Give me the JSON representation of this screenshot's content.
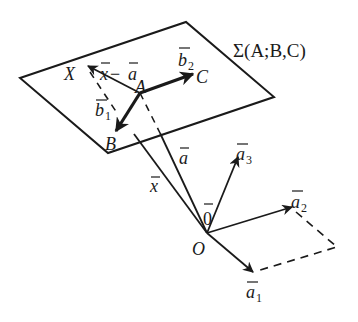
{
  "diagram": {
    "type": "vector-geometry",
    "plane_label": "Σ(A;B,C)",
    "points": {
      "X": "X",
      "A": "A",
      "B": "B",
      "C": "C",
      "O": "O"
    },
    "vectors": {
      "x_minus_a": {
        "base": "x",
        "op": " − ",
        "second": "a"
      },
      "b1": {
        "base": "b",
        "sub": "1"
      },
      "b2": {
        "base": "b",
        "sub": "2"
      },
      "a": {
        "base": "a"
      },
      "x": {
        "base": "x"
      },
      "zero": {
        "base": "0"
      },
      "a1": {
        "base": "a",
        "sub": "1"
      },
      "a2": {
        "base": "a",
        "sub": "2"
      },
      "a3": {
        "base": "a",
        "sub": "3"
      }
    },
    "colors": {
      "ink": "#1a1a1a",
      "background": "#ffffff"
    }
  }
}
